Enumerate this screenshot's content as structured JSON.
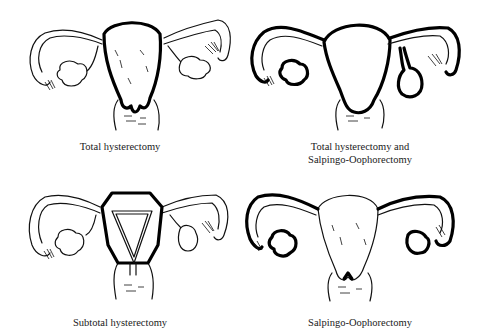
{
  "figure": {
    "panels": [
      {
        "id": "total-hysterectomy",
        "caption_lines": [
          "Total hysterectomy"
        ],
        "removed": [
          "uterus",
          "cervix"
        ]
      },
      {
        "id": "total-hysterectomy-salpingo-oophorectomy",
        "caption_lines": [
          "Total hysterectomy and",
          "Salpingo-Oophorectomy"
        ],
        "removed": [
          "uterus",
          "cervix",
          "fallopian tubes",
          "ovaries"
        ]
      },
      {
        "id": "subtotal-hysterectomy",
        "caption_lines": [
          "Subtotal hysterectomy"
        ],
        "removed": [
          "uterus body"
        ]
      },
      {
        "id": "salpingo-oophorectomy",
        "caption_lines": [
          "Salpingo-Oophorectomy"
        ],
        "removed": [
          "fallopian tubes",
          "ovaries"
        ]
      }
    ],
    "colors": {
      "line": "#111111",
      "background": "#ffffff"
    }
  }
}
